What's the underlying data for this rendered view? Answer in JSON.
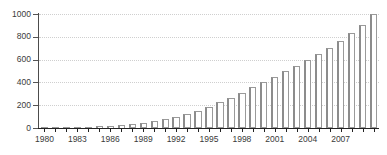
{
  "chart_data": {
    "type": "bar",
    "title": "",
    "xlabel": "",
    "ylabel": "",
    "ylim": [
      0,
      1000
    ],
    "ytick_values": [
      0,
      200,
      400,
      600,
      800,
      1000
    ],
    "ytick_labels": [
      "0",
      "200",
      "400",
      "600",
      "800",
      "1000"
    ],
    "xtick_labels": [
      "1980",
      "1983",
      "1986",
      "1989",
      "1992",
      "1995",
      "1998",
      "2001",
      "2004",
      "2007"
    ],
    "xtick_years": [
      1980,
      1983,
      1986,
      1989,
      1992,
      1995,
      1998,
      2001,
      2004,
      2007
    ],
    "grid": "horizontal-dotted",
    "legend": "none",
    "categories": [
      "1980",
      "1981",
      "1982",
      "1983",
      "1984",
      "1985",
      "1986",
      "1987",
      "1988",
      "1989",
      "1990",
      "1991",
      "1992",
      "1993",
      "1994",
      "1995",
      "1996",
      "1997",
      "1998",
      "1999",
      "2000",
      "2001",
      "2002",
      "2003",
      "2004",
      "2005",
      "2006",
      "2007",
      "2008",
      "2009",
      "2010"
    ],
    "values": [
      4,
      5,
      6,
      8,
      10,
      14,
      18,
      24,
      32,
      45,
      60,
      80,
      100,
      125,
      150,
      185,
      225,
      265,
      310,
      360,
      400,
      450,
      500,
      545,
      600,
      650,
      700,
      760,
      830,
      900,
      1000
    ],
    "colors": {
      "bar_fill": "#ffffff",
      "bar_border": "#9a9a9a",
      "bar_shadow": "#8c8c8c",
      "gridline": "#cfcfcf",
      "axis": "#222222",
      "tick_label": "#3a3a3a",
      "background": "#ffffff"
    }
  }
}
